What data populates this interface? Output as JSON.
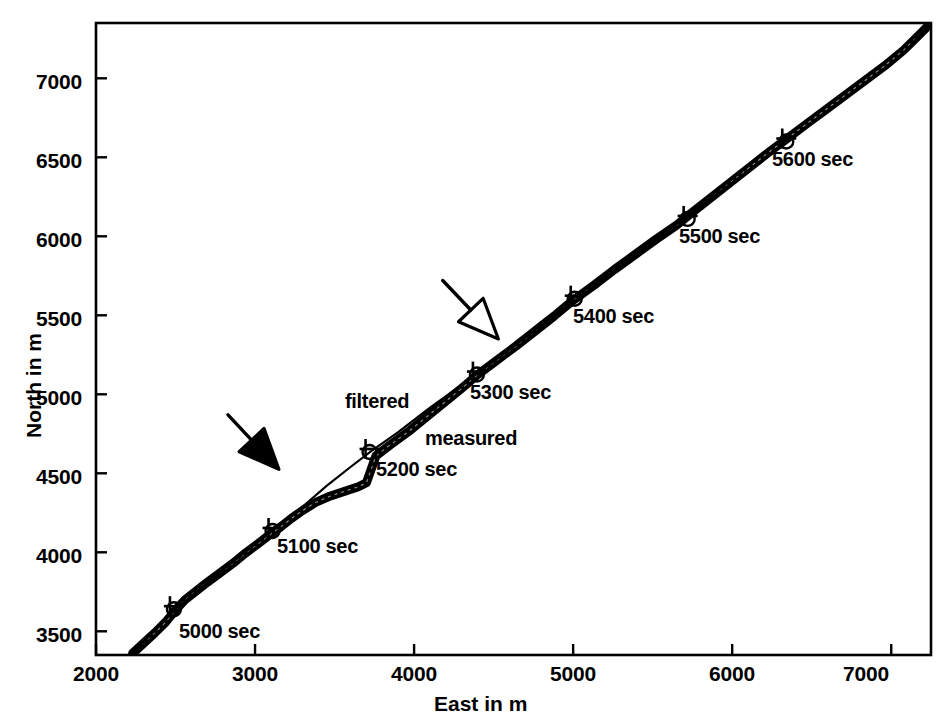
{
  "chart_data": {
    "type": "line",
    "title": "",
    "xlabel": "East in m",
    "ylabel": "North in m",
    "xlim": [
      2000,
      7250
    ],
    "ylim": [
      3350,
      7350
    ],
    "xticks": [
      2000,
      3000,
      4000,
      5000,
      6000,
      7000
    ],
    "xtick_labels": [
      "2000",
      "3000",
      "4000",
      "5000",
      "6000",
      "7000"
    ],
    "yticks": [
      3500,
      4000,
      4500,
      5000,
      5500,
      6000,
      6500,
      7000
    ],
    "ytick_labels": [
      "3500",
      "4000",
      "4500",
      "5000",
      "5500",
      "6000",
      "6500",
      "7000"
    ],
    "grid": false,
    "legend_position": "inline-annotations",
    "series": [
      {
        "name": "measured",
        "style": "thick-noisy-line",
        "marker": "circle",
        "points": [
          [
            2230,
            3360
          ],
          [
            2300,
            3425
          ],
          [
            2370,
            3490
          ],
          [
            2440,
            3560
          ],
          [
            2500,
            3635
          ],
          [
            2560,
            3700
          ],
          [
            2630,
            3755
          ],
          [
            2700,
            3810
          ],
          [
            2780,
            3870
          ],
          [
            2860,
            3930
          ],
          [
            2940,
            3995
          ],
          [
            3020,
            4055
          ],
          [
            3090,
            4110
          ],
          [
            3160,
            4160
          ],
          [
            3230,
            4215
          ],
          [
            3300,
            4265
          ],
          [
            3380,
            4315
          ],
          [
            3470,
            4355
          ],
          [
            3560,
            4385
          ],
          [
            3650,
            4415
          ],
          [
            3700,
            4440
          ],
          [
            3760,
            4610
          ],
          [
            3850,
            4680
          ],
          [
            3960,
            4760
          ],
          [
            4070,
            4850
          ],
          [
            4180,
            4940
          ],
          [
            4290,
            5030
          ],
          [
            4400,
            5125
          ],
          [
            4520,
            5215
          ],
          [
            4640,
            5305
          ],
          [
            4760,
            5400
          ],
          [
            4880,
            5495
          ],
          [
            5000,
            5595
          ],
          [
            5130,
            5690
          ],
          [
            5260,
            5790
          ],
          [
            5390,
            5885
          ],
          [
            5520,
            5980
          ],
          [
            5650,
            6070
          ],
          [
            5760,
            6160
          ],
          [
            5880,
            6255
          ],
          [
            6000,
            6350
          ],
          [
            6120,
            6445
          ],
          [
            6240,
            6540
          ],
          [
            6360,
            6630
          ],
          [
            6480,
            6720
          ],
          [
            6600,
            6810
          ],
          [
            6720,
            6900
          ],
          [
            6840,
            6990
          ],
          [
            6960,
            7080
          ],
          [
            7080,
            7180
          ],
          [
            7180,
            7280
          ],
          [
            7240,
            7340
          ]
        ]
      },
      {
        "name": "filtered",
        "style": "thin-smooth-line",
        "marker": "plus",
        "points": [
          [
            2230,
            3360
          ],
          [
            2500,
            3640
          ],
          [
            2800,
            3890
          ],
          [
            3100,
            4130
          ],
          [
            3300,
            4290
          ],
          [
            3450,
            4420
          ],
          [
            3600,
            4540
          ],
          [
            3730,
            4640
          ],
          [
            3900,
            4760
          ],
          [
            4100,
            4915
          ],
          [
            4300,
            5060
          ],
          [
            4450,
            5170
          ],
          [
            4650,
            5320
          ],
          [
            4900,
            5510
          ],
          [
            5050,
            5625
          ],
          [
            5300,
            5815
          ],
          [
            5600,
            6040
          ],
          [
            5900,
            6265
          ],
          [
            6200,
            6490
          ],
          [
            6500,
            6715
          ],
          [
            6800,
            6940
          ],
          [
            7050,
            7130
          ],
          [
            7240,
            7340
          ]
        ]
      }
    ],
    "time_markers": [
      {
        "label": "5000 sec",
        "x": 2490,
        "y": 3640
      },
      {
        "label": "5100 sec",
        "x": 3110,
        "y": 4135
      },
      {
        "label": "5200 sec",
        "x": 3720,
        "y": 4635
      },
      {
        "label": "5300 sec",
        "x": 4395,
        "y": 5125
      },
      {
        "label": "5400 sec",
        "x": 5010,
        "y": 5605
      },
      {
        "label": "5500 sec",
        "x": 5720,
        "y": 6110
      },
      {
        "label": "5600 sec",
        "x": 6340,
        "y": 6600
      }
    ],
    "annotations": [
      {
        "text": "filtered",
        "x": 3735,
        "y": 5000
      },
      {
        "text": "measured",
        "x": 4260,
        "y": 4760
      }
    ],
    "arrows": [
      {
        "name": "solid-arrow",
        "fill": "solid",
        "tail_x": 2830,
        "tail_y": 4870,
        "tip_x": 3150,
        "tip_y": 4525
      },
      {
        "name": "open-arrow",
        "fill": "hollow",
        "tail_x": 4180,
        "tail_y": 5720,
        "tip_x": 4530,
        "tip_y": 5350
      }
    ]
  },
  "axis": {
    "x_title": "East in m",
    "y_title": "North in m"
  },
  "colors": {
    "ink": "#000000",
    "background": "#ffffff"
  }
}
